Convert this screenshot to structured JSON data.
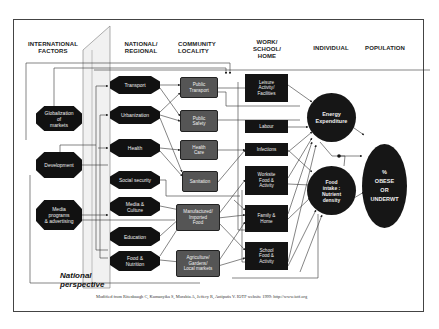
{
  "columns": {
    "international": "INTERNATIONAL\nFACTORS",
    "national": "NATIONAL/\nREGIONAL",
    "community": "COMMUNITY\nLOCALITY",
    "work": "WORK/\nSCHOOL/\nHOME",
    "individual": "INDIVIDUAL",
    "population": "POPULATION"
  },
  "international_factors": [
    {
      "label": "Globalization\nof\nmarkets"
    },
    {
      "label": "Development"
    },
    {
      "label": "Media\nprograms\n& advertising"
    }
  ],
  "national_factors": [
    {
      "label": "Transport"
    },
    {
      "label": "Urbanization"
    },
    {
      "label": "Health"
    },
    {
      "label": "Social security"
    },
    {
      "label": "Media &\nCulture"
    },
    {
      "label": "Education"
    },
    {
      "label": "Food &\nNutrition"
    }
  ],
  "community_factors": [
    {
      "label": "Public\nTransport"
    },
    {
      "label": "Public\nSafety"
    },
    {
      "label": "Health\nCare"
    },
    {
      "label": "Sanitation"
    },
    {
      "label": "Manufactured/\nImported\nFood"
    },
    {
      "label": "Agriculture/\nGardens/\nLocal markets"
    }
  ],
  "work_factors": [
    {
      "label": "Leisure\nActivity/\nFacilities"
    },
    {
      "label": "Labour"
    },
    {
      "label": "Infections"
    },
    {
      "label": "Worksite\nFood &\nActivity"
    },
    {
      "label": "Family &\nHome"
    },
    {
      "label": "School\nFood &\nActivity"
    }
  ],
  "individual": {
    "energy": "Energy\nExpenditure",
    "food": "Food\nintake :\nNutrient\ndensity"
  },
  "population": {
    "outcome": "%\nOBESE\nOR\nUNDERWT"
  },
  "national_perspective": "National\nperspective",
  "caption": "Modified from Ritenbaugh C,  Kumanyika S,  Morabia A,  Jeffery R,  Antipatis V.  IOTF website 1999: http://www.iotf.org",
  "colors": {
    "node_dark": "#111111",
    "node_grey": "#555555",
    "line": "#333333"
  }
}
